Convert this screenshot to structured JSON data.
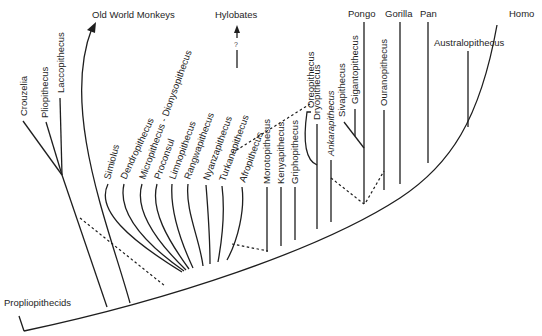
{
  "diagram": {
    "root_label": "Propliopithecids",
    "top_labels": {
      "old_world_monkeys": "Old World Monkeys",
      "hylobates": "Hylobates",
      "hylobates_uncertain_mark": "?",
      "pongo": "Pongo",
      "gorilla": "Gorilla",
      "pan": "Pan",
      "homo": "Homo",
      "australopithecus": "Australopithecus"
    },
    "early_catarrhines": [
      "Crouzelia",
      "Pliopithecus",
      "Laccopithecus"
    ],
    "proconsulid_radiation": [
      "Simiolus",
      "Dendropithecus",
      "Micropithecus - Dionysopithecus",
      "Proconsul",
      "Limnopithecus",
      "Rangwapithecus",
      "Nyanzapithecus",
      "Turkanapithecus",
      "Afropithecus"
    ],
    "middle_miocene": [
      "Morotopithecus",
      "Kenyapithecus",
      "Griphopithecus"
    ],
    "late_miocene": {
      "oreopithecus": "Oreopithecus",
      "dryopithecus": "Dryopithecus",
      "ankarapithecus": "Ankarapithecus",
      "sivapithecus": "Sivapithecus",
      "gigantopithecus": "Gigantopithecus",
      "ouranopithecus": "Ouranopithecus"
    }
  }
}
